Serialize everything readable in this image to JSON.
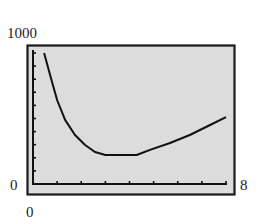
{
  "chart_data": {
    "type": "line",
    "title": "",
    "xlabel": "",
    "ylabel": "",
    "xlim": [
      0,
      8
    ],
    "ylim": [
      0,
      1000
    ],
    "x_tick_count": 8,
    "y_tick_count": 10,
    "x_tick_step": 1,
    "y_tick_step": 100,
    "grid": false,
    "legend": null,
    "window_labels": {
      "ymax": "1000",
      "ymin": "0",
      "xmin": "0",
      "xmax": "8"
    },
    "series": [
      {
        "name": "curve",
        "x": [
          0.46,
          0.71,
          1.0,
          1.33,
          1.74,
          2.16,
          2.57,
          3.0,
          3.5,
          4.0,
          4.3,
          4.85,
          5.68,
          6.5,
          7.34,
          8.0
        ],
        "y": [
          1000,
          832,
          641,
          489,
          374,
          298,
          244,
          221,
          221,
          221,
          221,
          260,
          313,
          374,
          450,
          511
        ]
      }
    ],
    "colors": {
      "background": "#dcdcdc",
      "frame": "#1a1a1a",
      "curve": "#111111"
    }
  }
}
